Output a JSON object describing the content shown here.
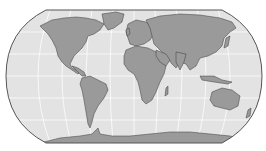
{
  "map": {
    "projection": "robinson",
    "colors": {
      "ocean": "#e3e3e3",
      "land": "#9a9a9a",
      "border": "#3a3a3a",
      "graticule": "#ffffff",
      "outline": "#555555",
      "background": "#ffffff"
    },
    "graticule": {
      "latitudes": [
        -60,
        -30,
        0,
        30,
        60
      ],
      "longitudes": [
        -150,
        -120,
        -90,
        -60,
        -30,
        0,
        30,
        60,
        90,
        120,
        150
      ]
    },
    "regions": [
      "North America",
      "South America",
      "Greenland",
      "Europe",
      "Africa",
      "Asia",
      "Australia",
      "Antarctica"
    ]
  }
}
